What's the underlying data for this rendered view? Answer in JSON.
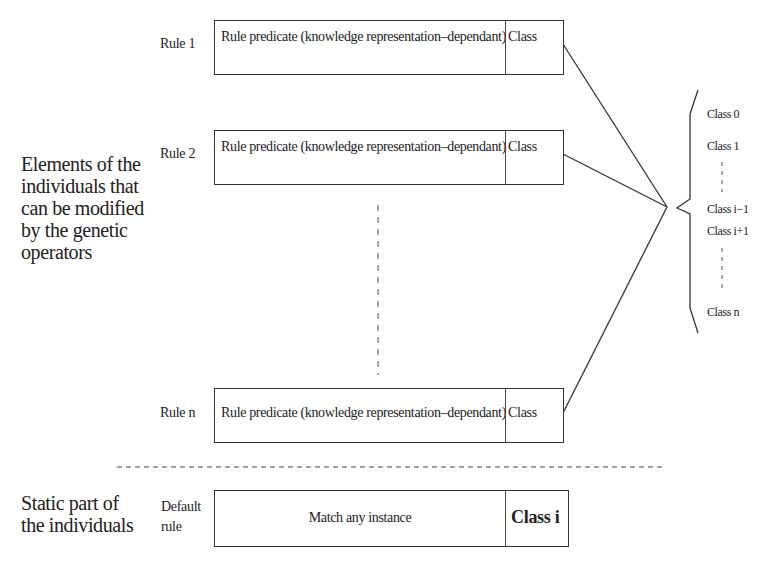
{
  "diagram": {
    "left_labels": {
      "modifiable": "Elements of the individuals that can be modified by the genetic operators",
      "modifiable_lines": [
        "Elements of the",
        "individuals that",
        "can be modified",
        "by the genetic",
        "operators"
      ],
      "static_lines": [
        "Static part of",
        "the individuals"
      ]
    },
    "rules": [
      {
        "label": "Rule 1",
        "predicate": "Rule predicate (knowledge representation–dependant)",
        "class": "Class"
      },
      {
        "label": "Rule 2",
        "predicate": "Rule predicate (knowledge representation–dependant)",
        "class": "Class"
      },
      {
        "label": "Rule n",
        "predicate": "Rule predicate (knowledge representation–dependant)",
        "class": "Class"
      }
    ],
    "default_rule": {
      "label_lines": [
        "Default",
        "rule"
      ],
      "predicate": "Match any instance",
      "class": "Class i"
    },
    "class_set": {
      "items": [
        "Class 0",
        "Class 1",
        "Class i−1",
        "Class i+1",
        "Class n"
      ]
    },
    "colors": {
      "line": "#333333",
      "text": "#222222",
      "background": "#ffffff"
    }
  }
}
